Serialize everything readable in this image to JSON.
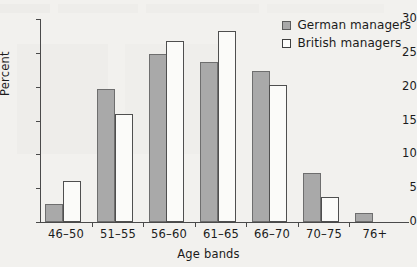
{
  "chart_data": {
    "type": "bar",
    "title": "",
    "xlabel": "Age bands",
    "ylabel": "Percent",
    "categories": [
      "46–50",
      "51–55",
      "56–60",
      "61–65",
      "66–70",
      "70–75",
      "76+"
    ],
    "series": [
      {
        "name": "German managers",
        "values": [
          2.7,
          19.6,
          24.8,
          23.7,
          22.3,
          7.3,
          1.3
        ]
      },
      {
        "name": "British managers",
        "values": [
          6.0,
          15.9,
          26.8,
          28.2,
          20.3,
          3.7,
          0
        ]
      }
    ],
    "ylim": [
      0,
      30
    ],
    "yticks": [
      "0",
      "5",
      "10",
      "15",
      "20",
      "25",
      "30"
    ],
    "ytick_values": [
      0,
      5,
      10,
      15,
      20,
      25,
      30
    ],
    "grid": false,
    "legend_position": "top-right",
    "colors": {
      "german_fill": "#a9a9a9",
      "german_stroke": "#6e6e6e",
      "british_fill": "#fbfbf9",
      "british_stroke": "#4f4f4f",
      "axis": "#4a4a4a",
      "text": "#1b1b1b",
      "background": "#f2f1ee"
    }
  }
}
